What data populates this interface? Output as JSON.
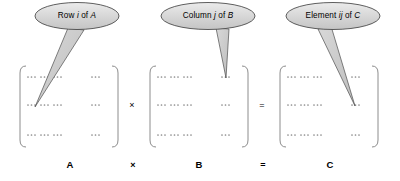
{
  "figure": {
    "background_color": "#ffffff",
    "callout_fill": "#d4d4d4",
    "callout_stroke": "#4d4d4d",
    "bracket_color": "#8c8c8c",
    "dots_color": "#8c8c8c",
    "text_color": "#000000"
  },
  "callouts": [
    {
      "id": "callout-row-a",
      "text_prefix": "Row ",
      "text_italic": "i",
      "text_middle": " of ",
      "text_italic2": "A",
      "full_text": "Row i of A",
      "points_to": "matrix-a-row-2"
    },
    {
      "id": "callout-column-b",
      "text_prefix": "Column ",
      "text_italic": "j",
      "text_middle": " of ",
      "text_italic2": "B",
      "full_text": "Column j of B",
      "points_to": "matrix-b-column-3"
    },
    {
      "id": "callout-element-c",
      "text_prefix": "Element ",
      "text_italic": "ij",
      "text_middle": " of ",
      "text_italic2": "C",
      "full_text": "Element ij of C",
      "points_to": "matrix-c-element-ij"
    }
  ],
  "matrices": [
    {
      "id": "matrix-a",
      "label": "A",
      "rows": 3,
      "dot_groups_per_row": 3,
      "trailing_group": 1
    },
    {
      "id": "matrix-b",
      "label": "B",
      "rows": 3,
      "dot_groups_per_row": 3,
      "trailing_group": 1
    },
    {
      "id": "matrix-c",
      "label": "C",
      "rows": 3,
      "dot_groups_per_row": 3,
      "trailing_group": 1
    }
  ],
  "operators": {
    "times_symbol": "×",
    "equals_symbol": "=",
    "bottom_times_symbol": "×",
    "bottom_equals_symbol": "="
  },
  "bottom_labels": {
    "a": "A",
    "times": "×",
    "b": "B",
    "equals": "=",
    "c": "C"
  }
}
